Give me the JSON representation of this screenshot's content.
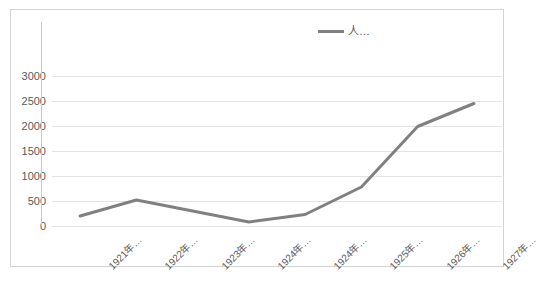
{
  "legend": {
    "label": "人…",
    "position": "top-center",
    "line_color": "#808080"
  },
  "axis": {
    "y_ticks": [
      "0",
      "500",
      "1000",
      "1500",
      "2000",
      "2500",
      "3000"
    ],
    "x_labels": [
      "1921年…",
      "1922年…",
      "1923年…",
      "1924年…",
      "1924年…",
      "1925年…",
      "1926年…",
      "1927年…"
    ]
  },
  "colors": {
    "series_line": "#808080",
    "gridline": "#e3e3e3",
    "frame": "#d4d4d4",
    "tick_text": "#5a5a5a"
  },
  "chart_data": {
    "type": "line",
    "title": "",
    "xlabel": "",
    "ylabel": "",
    "categories": [
      "1921年…",
      "1922年…",
      "1923年…",
      "1924年…",
      "1924年…",
      "1925年…",
      "1926年…",
      "1927年…"
    ],
    "series": [
      {
        "name": "人…",
        "color": "#808080",
        "values": [
          200,
          520,
          300,
          80,
          230,
          780,
          1990,
          2450
        ]
      }
    ],
    "ylim": [
      0,
      3000
    ],
    "ytick_step": 500,
    "grid": true,
    "legend_position": "top-center",
    "markers": false
  }
}
